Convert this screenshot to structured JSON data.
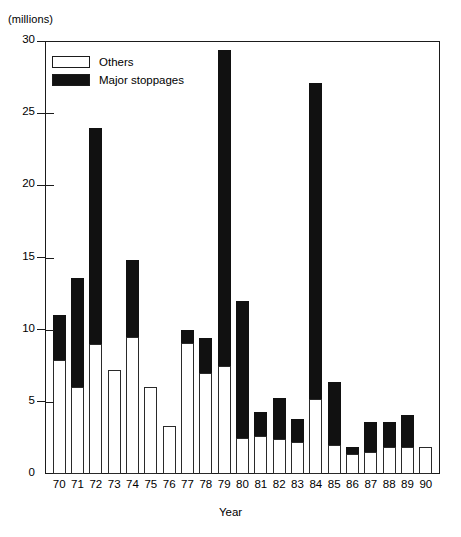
{
  "chart_data": {
    "type": "bar",
    "subtype": "stacked-vertical",
    "title": "",
    "units_label": "(millions)",
    "xlabel": "Year",
    "ylabel": "",
    "ylim": [
      0,
      30
    ],
    "y_ticks": [
      0,
      5,
      10,
      15,
      20,
      25,
      30
    ],
    "y_tick_labels": [
      "0",
      "5",
      "10",
      "15",
      "20",
      "25",
      "30"
    ],
    "grid": false,
    "legend_position": "top-left",
    "categories": [
      "70",
      "71",
      "72",
      "73",
      "74",
      "75",
      "76",
      "77",
      "78",
      "79",
      "80",
      "81",
      "82",
      "83",
      "84",
      "85",
      "86",
      "87",
      "88",
      "89",
      "90"
    ],
    "series": [
      {
        "name": "Others",
        "color": "#ffffff",
        "values": [
          7.9,
          6.0,
          9.0,
          7.2,
          9.5,
          6.0,
          3.3,
          9.1,
          7.0,
          7.5,
          2.5,
          2.6,
          2.4,
          2.2,
          5.2,
          2.0,
          1.4,
          1.5,
          1.9,
          1.9,
          1.9
        ]
      },
      {
        "name": "Major stoppages",
        "color": "#111111",
        "values": [
          3.1,
          7.6,
          15.0,
          0.0,
          5.3,
          0.0,
          0.0,
          0.9,
          2.4,
          21.9,
          9.5,
          1.7,
          2.9,
          1.6,
          21.9,
          4.4,
          0.5,
          2.1,
          1.7,
          2.2,
          0.0
        ]
      }
    ],
    "totals": [
      11.0,
      13.6,
      24.0,
      7.2,
      14.8,
      6.0,
      3.3,
      10.0,
      9.4,
      29.4,
      12.0,
      4.3,
      5.3,
      3.8,
      27.1,
      6.4,
      1.9,
      3.6,
      3.6,
      4.1,
      1.9
    ],
    "legend": [
      {
        "label": "Others",
        "swatch": "white"
      },
      {
        "label": "Major stoppages",
        "swatch": "black"
      }
    ],
    "colors": {
      "others": "#ffffff",
      "major_stoppages": "#111111",
      "axis": "#1b1b1b",
      "background": "#ffffff"
    }
  }
}
